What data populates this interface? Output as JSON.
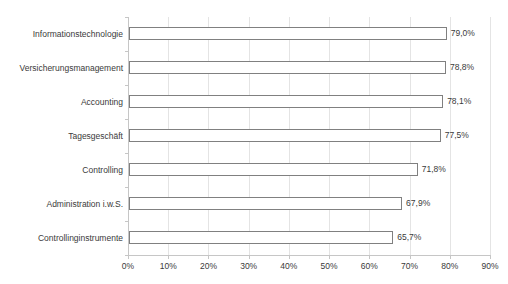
{
  "chart_data": {
    "type": "bar",
    "orientation": "horizontal",
    "title": "",
    "categories": [
      "Informationstechnologie",
      "Versicherungsmanagement",
      "Accounting",
      "Tagesgeschäft",
      "Controlling",
      "Administration i.w.S.",
      "Controllinginstrumente"
    ],
    "values": [
      79.0,
      78.8,
      78.1,
      77.5,
      71.8,
      67.9,
      65.7
    ],
    "value_labels": [
      "79,0%",
      "78,8%",
      "78,1%",
      "77,5%",
      "71,8%",
      "67,9%",
      "65,7%"
    ],
    "xlabel": "",
    "ylabel": "",
    "x_axis": {
      "min": 0,
      "max": 90,
      "step": 10,
      "tick_labels": [
        "0%",
        "10%",
        "20%",
        "30%",
        "40%",
        "50%",
        "60%",
        "70%",
        "80%",
        "90%"
      ]
    },
    "grid": true,
    "legend": "none",
    "colors": {
      "background": "#ffffff",
      "bar_fill": "#ffffff",
      "bar_border": "#808080",
      "axis_line": "#c6c6c6",
      "gridline": "#e4e4e4",
      "text": "#3a3a3a"
    }
  }
}
